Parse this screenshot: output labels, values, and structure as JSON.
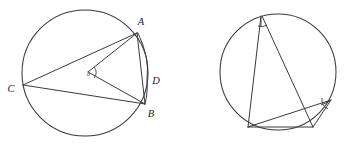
{
  "figure": {
    "background_color": "#ffffff",
    "stroke_color": "#3a3a3a",
    "label_color": "#1d1d1d",
    "width": 361,
    "height": 145
  },
  "left_figure": {
    "name": "circle-with-center-angle",
    "circle": {
      "cx": 85,
      "cy": 73,
      "r": 63
    },
    "points": [
      {
        "id": "A",
        "label": "A",
        "x": 137,
        "y": 33,
        "label_x": 141,
        "label_y": 24
      },
      {
        "id": "B",
        "label": "B",
        "x": 145,
        "y": 104,
        "label_x": 150,
        "label_y": 116
      },
      {
        "id": "C",
        "label": "C",
        "x": 23,
        "y": 85,
        "label_x": 10,
        "label_y": 91
      },
      {
        "id": "D",
        "label": "D",
        "x": 147,
        "y": 79,
        "label_x": 152,
        "label_y": 83
      },
      {
        "id": "O",
        "label": "o",
        "x": 88,
        "y": 72,
        "label_x": 90,
        "label_y": 75
      }
    ],
    "segments": [
      {
        "name": "chord-A-C",
        "from": "A",
        "to": "C"
      },
      {
        "name": "chord-A-B",
        "from": "A",
        "to": "B"
      },
      {
        "name": "chord-C-B",
        "from": "C",
        "to": "B"
      },
      {
        "name": "radius-O-A",
        "from": "O",
        "to": "A"
      },
      {
        "name": "radius-O-B",
        "from": "O",
        "to": "B"
      }
    ],
    "angle_marks": [
      {
        "name": "center-angle-mark",
        "at": "O"
      }
    ]
  },
  "right_figure": {
    "name": "circle-with-inscribed-angles",
    "circle": {
      "cx": 278,
      "cy": 72,
      "r": 58
    },
    "points": [
      {
        "id": "P",
        "label": "",
        "x": 261,
        "y": 16
      },
      {
        "id": "Q",
        "label": "",
        "x": 248,
        "y": 127
      },
      {
        "id": "R",
        "label": "",
        "x": 313,
        "y": 127
      },
      {
        "id": "S",
        "label": "",
        "x": 331,
        "y": 100
      }
    ],
    "segments": [
      {
        "name": "chord-P-Q",
        "from": "P",
        "to": "Q"
      },
      {
        "name": "chord-P-R",
        "from": "P",
        "to": "R"
      },
      {
        "name": "chord-Q-R",
        "from": "Q",
        "to": "R"
      },
      {
        "name": "chord-Q-S",
        "from": "Q",
        "to": "S"
      },
      {
        "name": "chord-R-S",
        "from": "R",
        "to": "S"
      }
    ],
    "angle_marks": [
      {
        "name": "apex-angle-mark",
        "at": "P"
      },
      {
        "name": "right-angle-mark",
        "at": "S"
      }
    ]
  }
}
